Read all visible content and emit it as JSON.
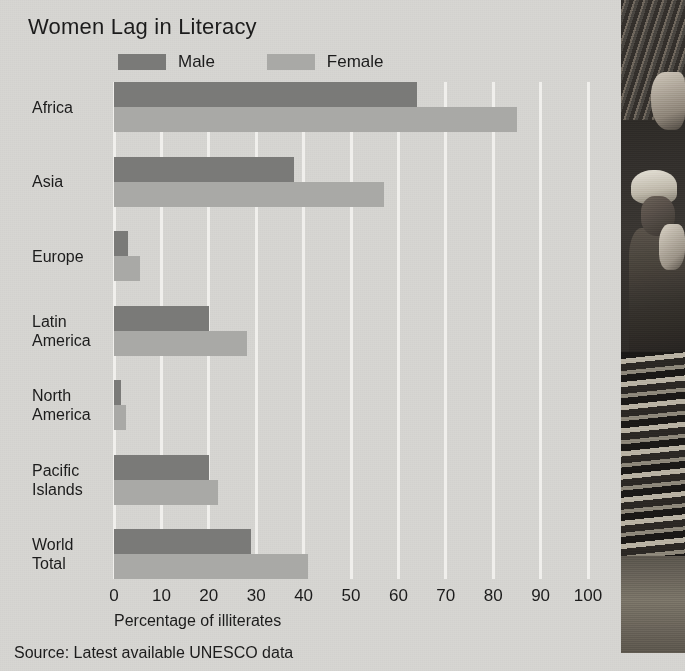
{
  "title": "Women Lag in Literacy",
  "source_note": "Source: Latest available UNESCO data",
  "legend": [
    {
      "label": "Male",
      "color": "#7a7a78",
      "swatch_name": "legend-swatch-male"
    },
    {
      "label": "Female",
      "color": "#a9a9a6",
      "swatch_name": "legend-swatch-female"
    }
  ],
  "photo": {
    "caption": "",
    "alt_name": "woman-carrying-load-photo"
  },
  "chart_data": {
    "type": "bar",
    "orientation": "horizontal",
    "title": "Women Lag in Literacy",
    "xlabel": "Percentage of illiterates",
    "ylabel": "",
    "xlim": [
      0,
      100
    ],
    "xticks": [
      0,
      10,
      20,
      30,
      40,
      50,
      60,
      70,
      80,
      90,
      100
    ],
    "xtick_labels": [
      "0",
      "10",
      "20",
      "30",
      "40",
      "50",
      "60",
      "70",
      "80",
      "90",
      "100"
    ],
    "grid": true,
    "grid_axis": "x",
    "legend_position": "top-left",
    "categories": [
      "Africa",
      "Asia",
      "Europe",
      "Latin\nAmerica",
      "North\nAmerica",
      "Pacific\nIslands",
      "World\nTotal"
    ],
    "series": [
      {
        "name": "Male",
        "color": "#7a7a78",
        "values": [
          64,
          38,
          3,
          20,
          1.5,
          20,
          29
        ]
      },
      {
        "name": "Female",
        "color": "#a9a9a6",
        "values": [
          85,
          57,
          5.5,
          28,
          2.5,
          22,
          41
        ]
      }
    ],
    "units": "percent",
    "annotations": [
      "Source: Latest available UNESCO data"
    ]
  }
}
